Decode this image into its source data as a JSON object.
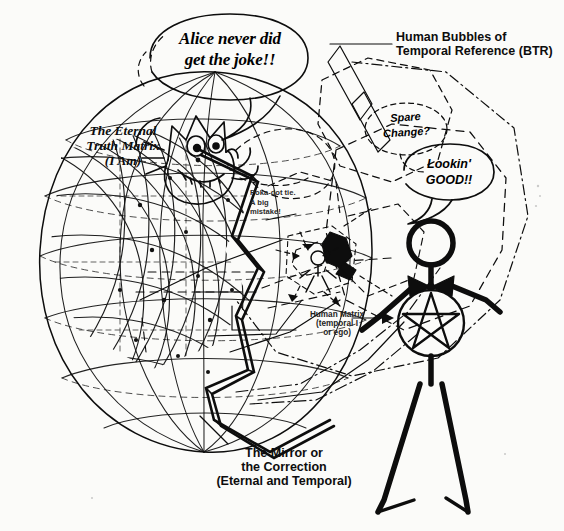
{
  "canvas": {
    "width": 564,
    "height": 531,
    "background": "#fbfbf9",
    "ink": "#0d0d0d"
  },
  "diagram": {
    "kind": "hand-drawn-concept-sketch",
    "labels": {
      "eternal_matrix": "The Eternal\nTruth Matrix\n(I Am)",
      "btr": "Human Bubbles of\nTemporal Reference (BTR)",
      "human_matrix": "Human Matrix\n(temporal I\nor ego)",
      "mirror": "The Mirror or\nthe Correction\n(Eternal and Temporal)",
      "polka_note": "Poka-dot tie.\nA big\nmistake!"
    },
    "speech_bubbles": [
      {
        "id": "alice",
        "text": "Alice never did\nget the joke!!",
        "speaker": "cheshire-cat",
        "style": "solid-outline"
      },
      {
        "id": "spare_change",
        "text": "Spare\nChange?",
        "speaker": "btr-bubble",
        "style": "dashed-outline"
      },
      {
        "id": "lookin_good",
        "text": "Lookin'\nGOOD!!",
        "speaker": "stick-figure",
        "style": "solid-outline"
      }
    ],
    "figures": [
      {
        "id": "cheshire-cat",
        "name": "Cheshire cat face with grin"
      },
      {
        "id": "stick-figure",
        "name": "Stick figure with pentagram body and bow tie"
      },
      {
        "id": "small-reflection",
        "name": "Small reflected figure inside matrix"
      },
      {
        "id": "sphere",
        "name": "Wireframe sphere / eternal truth matrix"
      },
      {
        "id": "mirror-band",
        "name": "Zigzag mirror band"
      }
    ]
  }
}
